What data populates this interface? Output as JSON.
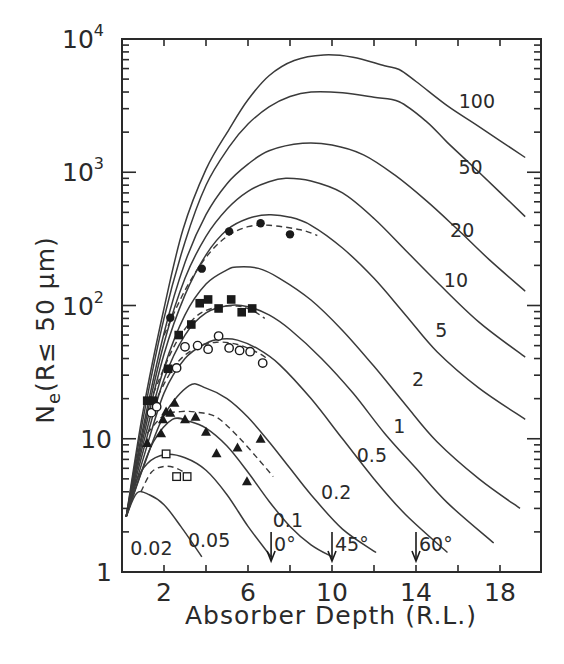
{
  "chart_data": {
    "type": "line",
    "title": "",
    "xlabel": "Absorber Depth (R.L.)",
    "ylabel": "Ne(R≤ 50 μm)",
    "ylabel_parts": {
      "main": "N",
      "sub": "e",
      "rest": "(R≤ 50 μm)"
    },
    "xlim": [
      0,
      20
    ],
    "ylim": [
      1,
      10000
    ],
    "yscale": "log",
    "grid": false,
    "legend": "none (curves labeled inline by energy parameter)",
    "x_ticks": [
      {
        "value": 2,
        "label": "2"
      },
      {
        "value": 6,
        "label": "6"
      },
      {
        "value": 10,
        "label": "10"
      },
      {
        "value": 14,
        "label": "14"
      },
      {
        "value": 18,
        "label": "18"
      }
    ],
    "x_minor_ticks": [
      4,
      8,
      12,
      16
    ],
    "y_ticks": [
      {
        "value": 1,
        "label": "1",
        "exp": ""
      },
      {
        "value": 10,
        "label": "10",
        "exp": ""
      },
      {
        "value": 100,
        "label": "10",
        "exp": "2"
      },
      {
        "value": 1000,
        "label": "10",
        "exp": "3"
      },
      {
        "value": 10000,
        "label": "10",
        "exp": "4"
      }
    ],
    "series": [
      {
        "name": "100",
        "label_pos": [
          16.9,
          3400
        ],
        "points": [
          [
            0.2,
            2.6
          ],
          [
            1,
            16
          ],
          [
            2,
            95
          ],
          [
            2.9,
            370
          ],
          [
            4,
            1050
          ],
          [
            5.1,
            2100
          ],
          [
            6,
            3500
          ],
          [
            7,
            5300
          ],
          [
            8.2,
            6900
          ],
          [
            9.6,
            7600
          ],
          [
            11,
            7300
          ],
          [
            12.5,
            6300
          ],
          [
            13.2,
            5900
          ],
          [
            14,
            4800
          ],
          [
            15.5,
            3150
          ],
          [
            17,
            2200
          ],
          [
            19.2,
            1290
          ]
        ]
      },
      {
        "name": "50",
        "label_pos": [
          16.6,
          1100
        ],
        "points": [
          [
            0.2,
            2.6
          ],
          [
            1,
            14
          ],
          [
            2,
            80
          ],
          [
            3,
            300
          ],
          [
            4,
            800
          ],
          [
            5.1,
            1550
          ],
          [
            6,
            2300
          ],
          [
            7,
            3100
          ],
          [
            8,
            3700
          ],
          [
            9,
            4000
          ],
          [
            10.5,
            3950
          ],
          [
            12,
            3650
          ],
          [
            13.2,
            3380
          ],
          [
            14.5,
            2400
          ],
          [
            15.5,
            1670
          ],
          [
            17,
            1000
          ],
          [
            19.2,
            465
          ]
        ]
      },
      {
        "name": "20",
        "label_pos": [
          16.2,
          370
        ],
        "points": [
          [
            0.2,
            2.6
          ],
          [
            1,
            12
          ],
          [
            2,
            62
          ],
          [
            3,
            210
          ],
          [
            4,
            480
          ],
          [
            5,
            820
          ],
          [
            6,
            1150
          ],
          [
            7,
            1450
          ],
          [
            8.6,
            1650
          ],
          [
            10,
            1600
          ],
          [
            11.5,
            1350
          ],
          [
            13,
            950
          ],
          [
            14.5,
            610
          ],
          [
            16,
            370
          ],
          [
            17.5,
            220
          ],
          [
            19.2,
            128
          ]
        ]
      },
      {
        "name": "10",
        "label_pos": [
          15.9,
          155
        ],
        "points": [
          [
            0.2,
            2.6
          ],
          [
            1,
            11
          ],
          [
            2,
            52
          ],
          [
            3,
            160
          ],
          [
            4,
            330
          ],
          [
            5,
            530
          ],
          [
            6,
            720
          ],
          [
            7,
            850
          ],
          [
            7.8,
            900
          ],
          [
            9,
            860
          ],
          [
            10.5,
            700
          ],
          [
            12,
            450
          ],
          [
            13.5,
            260
          ],
          [
            15,
            150
          ],
          [
            17,
            75
          ],
          [
            19.2,
            41
          ]
        ]
      },
      {
        "name": "5",
        "label_pos": [
          15.2,
          65
        ],
        "points": [
          [
            0.2,
            2.6
          ],
          [
            1,
            10
          ],
          [
            2,
            43
          ],
          [
            3,
            120
          ],
          [
            4,
            240
          ],
          [
            5,
            370
          ],
          [
            6,
            450
          ],
          [
            7,
            480
          ],
          [
            8,
            460
          ],
          [
            9,
            400
          ],
          [
            10.5,
            270
          ],
          [
            12,
            160
          ],
          [
            13.5,
            85
          ],
          [
            15,
            45
          ],
          [
            17,
            24
          ],
          [
            19.2,
            14
          ]
        ]
      },
      {
        "name": "2",
        "label_pos": [
          14.1,
          28
        ],
        "points": [
          [
            0.2,
            2.6
          ],
          [
            1,
            9
          ],
          [
            2,
            34
          ],
          [
            3,
            85
          ],
          [
            4,
            145
          ],
          [
            5,
            185
          ],
          [
            5.5,
            195
          ],
          [
            6.5,
            190
          ],
          [
            7.5,
            160
          ],
          [
            9,
            110
          ],
          [
            10.5,
            65
          ],
          [
            12,
            35
          ],
          [
            13.5,
            18
          ],
          [
            15,
            9.5
          ],
          [
            17,
            5
          ],
          [
            18.95,
            3.0
          ]
        ]
      },
      {
        "name": "1",
        "label_pos": [
          13.2,
          12.5
        ],
        "points": [
          [
            0.2,
            2.6
          ],
          [
            1,
            8
          ],
          [
            2,
            28
          ],
          [
            3,
            60
          ],
          [
            4,
            88
          ],
          [
            5.1,
            100
          ],
          [
            6,
            98
          ],
          [
            7,
            85
          ],
          [
            8,
            66
          ],
          [
            9.5,
            40
          ],
          [
            11,
            22
          ],
          [
            12.5,
            11
          ],
          [
            14,
            6
          ],
          [
            15.5,
            3.3
          ],
          [
            17.7,
            1.65
          ]
        ]
      },
      {
        "name": "0.5",
        "label_pos": [
          11.9,
          7.5
        ],
        "points": [
          [
            0.2,
            2.6
          ],
          [
            1,
            7
          ],
          [
            2,
            22
          ],
          [
            3,
            40
          ],
          [
            4,
            52
          ],
          [
            4.7,
            56
          ],
          [
            5.5,
            55
          ],
          [
            6.5,
            47
          ],
          [
            7.5,
            36
          ],
          [
            9,
            20
          ],
          [
            10.5,
            10
          ],
          [
            12,
            5
          ],
          [
            13.5,
            2.7
          ],
          [
            15.5,
            1.4
          ]
        ]
      },
      {
        "name": "0.2",
        "label_pos": [
          10.2,
          4.0
        ],
        "points": [
          [
            0.2,
            2.6
          ],
          [
            1,
            6
          ],
          [
            2,
            15
          ],
          [
            3.2,
            25
          ],
          [
            4,
            24
          ],
          [
            5,
            20
          ],
          [
            6,
            14.5
          ],
          [
            7,
            9.5
          ],
          [
            8,
            6
          ],
          [
            9,
            3.8
          ],
          [
            10.5,
            2.1
          ],
          [
            12.1,
            1.4
          ]
        ]
      },
      {
        "name": "0.1",
        "label_pos": [
          7.9,
          2.45
        ],
        "points": [
          [
            0.2,
            2.6
          ],
          [
            0.8,
            5
          ],
          [
            1.5,
            9.5
          ],
          [
            2.4,
            14
          ],
          [
            3.2,
            13.5
          ],
          [
            4,
            12
          ],
          [
            5,
            8.8
          ],
          [
            6,
            5.6
          ],
          [
            7,
            3.4
          ],
          [
            8,
            2.2
          ],
          [
            9,
            1.6
          ],
          [
            10,
            1.3
          ]
        ]
      },
      {
        "name": "0.05",
        "label_pos": [
          4.15,
          1.75
        ],
        "points": [
          [
            0.2,
            2.6
          ],
          [
            0.6,
            4.5
          ],
          [
            1.2,
            6.5
          ],
          [
            2.05,
            7.6
          ],
          [
            3,
            7.2
          ],
          [
            4,
            5.8
          ],
          [
            5,
            3.8
          ],
          [
            6,
            2.2
          ],
          [
            7.1,
            1.3
          ]
        ]
      },
      {
        "name": "0.02",
        "label_pos": [
          1.4,
          1.52
        ],
        "points": [
          [
            0.2,
            2.6
          ],
          [
            0.7,
            3.9
          ],
          [
            1.3,
            3.8
          ],
          [
            2,
            3.2
          ],
          [
            2.8,
            2.2
          ],
          [
            3.8,
            1.3
          ]
        ]
      }
    ],
    "dashed_fits": [
      {
        "name": "fit-filled-circles",
        "points": [
          [
            2.0,
            60
          ],
          [
            3,
            130
          ],
          [
            4,
            230
          ],
          [
            5,
            330
          ],
          [
            6,
            390
          ],
          [
            7,
            400
          ],
          [
            8.5,
            370
          ],
          [
            9.3,
            335
          ]
        ]
      },
      {
        "name": "fit-filled-squares",
        "points": [
          [
            1.5,
            22
          ],
          [
            2.5,
            50
          ],
          [
            3.5,
            82
          ],
          [
            4.5,
            97
          ],
          [
            5.5,
            99
          ],
          [
            6.2,
            92
          ],
          [
            6.8,
            80
          ]
        ]
      },
      {
        "name": "fit-open-circles",
        "points": [
          [
            1.5,
            18
          ],
          [
            2.5,
            35
          ],
          [
            3.5,
            48
          ],
          [
            4.5,
            53
          ],
          [
            5.5,
            51
          ],
          [
            6.5,
            44
          ],
          [
            6.9,
            40
          ]
        ]
      },
      {
        "name": "fit-filled-triangles",
        "points": [
          [
            1.2,
            11
          ],
          [
            2,
            15
          ],
          [
            2.8,
            16
          ],
          [
            3.6,
            15.8
          ],
          [
            4.5,
            14.5
          ],
          [
            5.5,
            10.5
          ],
          [
            6.5,
            7
          ],
          [
            7.2,
            5.2
          ]
        ]
      },
      {
        "name": "fit-open-squares",
        "points": [
          [
            0.9,
            4
          ],
          [
            1.4,
            5.6
          ],
          [
            2,
            6.2
          ],
          [
            2.6,
            6.0
          ],
          [
            3.2,
            5.3
          ]
        ]
      }
    ],
    "data_points": [
      {
        "marker": "filled-circle",
        "points": [
          [
            2.3,
            81
          ],
          [
            3.8,
            189
          ],
          [
            5.1,
            360
          ],
          [
            6.6,
            414
          ],
          [
            8.0,
            342
          ]
        ]
      },
      {
        "marker": "filled-square",
        "points": [
          [
            1.2,
            19.3
          ],
          [
            1.5,
            19.3
          ],
          [
            2.2,
            33.5
          ],
          [
            2.7,
            60
          ],
          [
            3.3,
            72
          ],
          [
            3.7,
            104
          ],
          [
            4.1,
            111
          ],
          [
            4.6,
            95
          ],
          [
            5.2,
            111
          ],
          [
            5.7,
            89
          ],
          [
            6.2,
            95
          ]
        ]
      },
      {
        "marker": "open-circle",
        "points": [
          [
            1.4,
            15.7
          ],
          [
            1.65,
            17.4
          ],
          [
            2.6,
            34
          ],
          [
            3.0,
            49
          ],
          [
            3.6,
            50
          ],
          [
            4.1,
            47
          ],
          [
            4.6,
            59
          ],
          [
            5.1,
            48
          ],
          [
            5.6,
            46
          ],
          [
            6.1,
            45
          ],
          [
            6.7,
            37
          ]
        ]
      },
      {
        "marker": "filled-triangle",
        "points": [
          [
            1.2,
            9.3
          ],
          [
            1.86,
            11
          ],
          [
            1.95,
            14
          ],
          [
            2.1,
            16
          ],
          [
            2.3,
            15.7
          ],
          [
            2.5,
            18.6
          ],
          [
            3.0,
            14
          ],
          [
            3.5,
            14.6
          ],
          [
            4.0,
            11.3
          ],
          [
            4.5,
            7.8
          ],
          [
            5.5,
            8.6
          ],
          [
            6.6,
            10
          ],
          [
            5.95,
            4.8
          ]
        ]
      },
      {
        "marker": "open-square",
        "points": [
          [
            2.1,
            7.7
          ],
          [
            2.6,
            5.2
          ],
          [
            3.1,
            5.2
          ]
        ]
      }
    ],
    "annotations": [
      {
        "label": "0°",
        "arrow_x": 7.1,
        "text": "0°",
        "note": "shower-max arrow"
      },
      {
        "label": "45°",
        "arrow_x": 10.0,
        "text": "45°"
      },
      {
        "label": "60°",
        "arrow_x": 14.0,
        "text": "60°"
      }
    ]
  }
}
